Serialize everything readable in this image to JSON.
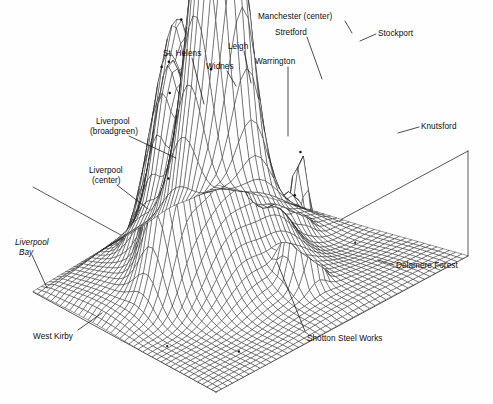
{
  "figure": {
    "title": "",
    "type": "3d-wireframe-surface",
    "background_color": "#fefefe",
    "line_color": "#111111",
    "width": 493,
    "height": 404
  },
  "labels": [
    {
      "id": "manchester-center",
      "text": "Manchester (center)",
      "x": 258,
      "y": 12,
      "align": "left",
      "italic": false
    },
    {
      "id": "stretford",
      "text": "Stretford",
      "x": 275,
      "y": 28,
      "align": "left",
      "italic": false
    },
    {
      "id": "stockport",
      "text": "Stockport",
      "x": 378,
      "y": 29,
      "align": "left",
      "italic": false
    },
    {
      "id": "st-helens",
      "text": "St. Helens",
      "x": 163,
      "y": 49,
      "align": "left",
      "italic": false
    },
    {
      "id": "leigh",
      "text": "Leigh",
      "x": 228,
      "y": 42,
      "align": "left",
      "italic": false
    },
    {
      "id": "widnes",
      "text": "Widnes",
      "x": 206,
      "y": 62,
      "align": "left",
      "italic": false
    },
    {
      "id": "warrington",
      "text": "Warrington",
      "x": 255,
      "y": 57,
      "align": "left",
      "italic": false
    },
    {
      "id": "knutsford",
      "text": "Knutsford",
      "x": 421,
      "y": 122,
      "align": "left",
      "italic": false
    },
    {
      "id": "liverpool-broadgreen-1",
      "text": "Liverpool",
      "x": 96,
      "y": 117,
      "align": "left",
      "italic": false
    },
    {
      "id": "liverpool-broadgreen-2",
      "text": "(broadgreen)",
      "x": 90,
      "y": 127,
      "align": "left",
      "italic": false
    },
    {
      "id": "liverpool-center-1",
      "text": "Liverpool",
      "x": 89,
      "y": 166,
      "align": "left",
      "italic": false
    },
    {
      "id": "liverpool-center-2",
      "text": "(center)",
      "x": 92,
      "y": 176,
      "align": "left",
      "italic": false
    },
    {
      "id": "liverpool-bay-1",
      "text": "Liverpool",
      "x": 15,
      "y": 238,
      "align": "left",
      "italic": true
    },
    {
      "id": "liverpool-bay-2",
      "text": "Bay",
      "x": 19,
      "y": 248,
      "align": "left",
      "italic": true
    },
    {
      "id": "west-kirby",
      "text": "West Kirby",
      "x": 33,
      "y": 332,
      "align": "left",
      "italic": false
    },
    {
      "id": "delamere-forest",
      "text": "Delamere Forest",
      "x": 396,
      "y": 261,
      "align": "left",
      "italic": false
    },
    {
      "id": "shotton-steel",
      "text": "Shotton Steel Works",
      "x": 307,
      "y": 334,
      "align": "left",
      "italic": false
    }
  ],
  "leader_lines": [
    {
      "id": "leader-manchester-center",
      "points": [
        [
          345,
          21
        ],
        [
          352,
          33
        ]
      ]
    },
    {
      "id": "leader-stretford",
      "points": [
        [
          307,
          37
        ],
        [
          322,
          79
        ]
      ]
    },
    {
      "id": "leader-stockport",
      "points": [
        [
          376,
          34
        ],
        [
          360,
          41
        ]
      ]
    },
    {
      "id": "leader-st-helens",
      "points": [
        [
          192,
          58
        ],
        [
          204,
          104
        ]
      ]
    },
    {
      "id": "leader-leigh",
      "points": [
        [
          244,
          51
        ],
        [
          251,
          83
        ]
      ]
    },
    {
      "id": "leader-widnes",
      "points": [
        [
          227,
          71
        ],
        [
          236,
          86
        ]
      ]
    },
    {
      "id": "leader-warrington",
      "points": [
        [
          288,
          67
        ],
        [
          288,
          136
        ]
      ]
    },
    {
      "id": "leader-knutsford",
      "points": [
        [
          419,
          127
        ],
        [
          398,
          133
        ]
      ]
    },
    {
      "id": "leader-liverpool-broadgreen",
      "points": [
        [
          129,
          136
        ],
        [
          176,
          158
        ]
      ]
    },
    {
      "id": "leader-liverpool-center",
      "points": [
        [
          117,
          185
        ],
        [
          148,
          209
        ]
      ]
    },
    {
      "id": "leader-liverpool-bay",
      "points": [
        [
          32,
          255
        ],
        [
          47,
          288
        ]
      ]
    },
    {
      "id": "leader-west-kirby",
      "points": [
        [
          78,
          330
        ],
        [
          102,
          313
        ]
      ]
    },
    {
      "id": "leader-delamere-forest",
      "points": [
        [
          394,
          265
        ],
        [
          378,
          260
        ]
      ]
    },
    {
      "id": "leader-shotton-steel",
      "points": [
        [
          305,
          331
        ],
        [
          277,
          262
        ]
      ]
    }
  ],
  "chart_data": {
    "type": "surface",
    "projection": "axonometric",
    "title": "",
    "xlabel": "",
    "ylabel": "",
    "zlabel": "",
    "grid": true,
    "legend": null,
    "nx": 46,
    "ny": 40,
    "zlim": [
      0,
      1
    ],
    "z_clip": 0.92,
    "peaks": [
      {
        "name": "Manchester (center)",
        "u": 0.74,
        "v": 0.17,
        "amp": 1.38,
        "sx": 0.072,
        "sy": 0.07
      },
      {
        "name": "Stretford",
        "u": 0.672,
        "v": 0.23,
        "amp": 0.62,
        "sx": 0.055,
        "sy": 0.06
      },
      {
        "name": "Stockport",
        "u": 0.83,
        "v": 0.215,
        "amp": 0.92,
        "sx": 0.058,
        "sy": 0.062
      },
      {
        "name": "St. Helens",
        "u": 0.392,
        "v": 0.268,
        "amp": 0.6,
        "sx": 0.06,
        "sy": 0.065
      },
      {
        "name": "Leigh",
        "u": 0.52,
        "v": 0.182,
        "amp": 0.7,
        "sx": 0.052,
        "sy": 0.055
      },
      {
        "name": "Widnes",
        "u": 0.455,
        "v": 0.3,
        "amp": 0.5,
        "sx": 0.046,
        "sy": 0.05
      },
      {
        "name": "Warrington",
        "u": 0.568,
        "v": 0.33,
        "amp": 0.55,
        "sx": 0.052,
        "sy": 0.056
      },
      {
        "name": "Knutsford",
        "u": 0.812,
        "v": 0.47,
        "amp": 0.3,
        "sx": 0.04,
        "sy": 0.044
      },
      {
        "name": "Liverpool (broadgreen)",
        "u": 0.3,
        "v": 0.4,
        "amp": 0.7,
        "sx": 0.058,
        "sy": 0.062
      },
      {
        "name": "Liverpool (center)",
        "u": 0.228,
        "v": 0.47,
        "amp": 0.66,
        "sx": 0.055,
        "sy": 0.06
      },
      {
        "name": "Shotton Steel Works",
        "u": 0.558,
        "v": 0.745,
        "amp": 0.74,
        "sx": 0.034,
        "sy": 0.036
      },
      {
        "name": "ridge-mid",
        "u": 0.62,
        "v": 0.52,
        "amp": 0.34,
        "sx": 0.09,
        "sy": 0.08
      },
      {
        "name": "ridge-north",
        "u": 0.47,
        "v": 0.43,
        "amp": 0.4,
        "sx": 0.085,
        "sy": 0.09
      },
      {
        "name": "plateau-west",
        "u": 0.33,
        "v": 0.56,
        "amp": 0.36,
        "sx": 0.1,
        "sy": 0.095
      }
    ],
    "flats": [
      {
        "name": "Liverpool Bay",
        "u": 0.075,
        "v": 0.64,
        "level": 0.0
      },
      {
        "name": "West Kirby",
        "u": 0.2,
        "v": 0.86,
        "level": 0.02
      },
      {
        "name": "Delamere Forest",
        "u": 0.9,
        "v": 0.64,
        "level": 0.01
      }
    ]
  }
}
